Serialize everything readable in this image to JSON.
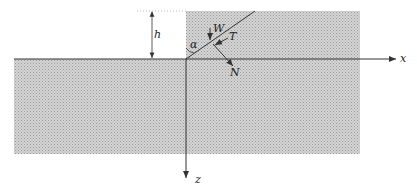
{
  "diagram": {
    "labels": {
      "h": "h",
      "alpha": "α",
      "W": "W",
      "T": "T",
      "N": "N",
      "x": "x",
      "z": "z"
    },
    "colors": {
      "fill": "#c8c8c8",
      "line": "#333333"
    }
  }
}
